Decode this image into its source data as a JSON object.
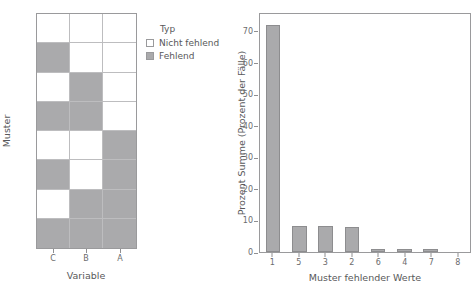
{
  "legend": {
    "title": "Typ",
    "items": [
      {
        "label": "Nicht fehlend",
        "swatch": "present",
        "color": "#ffffff"
      },
      {
        "label": "Fehlend",
        "swatch": "missing",
        "color": "#aaaaac"
      }
    ]
  },
  "colors": {
    "missing": "#aaaaac",
    "present": "#ffffff",
    "axis": "#9a9a9c",
    "text": "#58585a"
  },
  "chart_data": [
    {
      "type": "heatmap",
      "title": "",
      "xlabel": "Variable",
      "ylabel": "Muster",
      "categories_x": [
        "C",
        "B",
        "A"
      ],
      "categories_y": [
        "1",
        "2",
        "3",
        "4",
        "5",
        "6",
        "7",
        "8"
      ],
      "value_labels": {
        "0": "Nicht fehlend",
        "1": "Fehlend"
      },
      "legend_position": "right",
      "grid": true,
      "values": [
        [
          0,
          0,
          0
        ],
        [
          1,
          0,
          0
        ],
        [
          0,
          1,
          0
        ],
        [
          1,
          1,
          0
        ],
        [
          0,
          0,
          1
        ],
        [
          1,
          0,
          1
        ],
        [
          0,
          1,
          1
        ],
        [
          1,
          1,
          1
        ]
      ]
    },
    {
      "type": "bar",
      "title": "",
      "xlabel": "Muster fehlender Werte",
      "ylabel": "Prozent Summe (Prozent der Fälle)",
      "categories": [
        "1",
        "5",
        "3",
        "2",
        "6",
        "4",
        "7",
        "8"
      ],
      "values": [
        72.5,
        8.3,
        8.3,
        8.0,
        1.0,
        1.0,
        1.0,
        0.0
      ],
      "yticks": [
        0,
        10,
        20,
        30,
        40,
        50,
        60,
        70
      ],
      "ylim": [
        0,
        76
      ],
      "grid": false,
      "legend_position": "none"
    }
  ]
}
